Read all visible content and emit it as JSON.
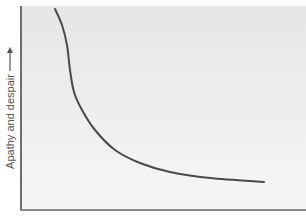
{
  "chart_data": {
    "type": "line",
    "title": "",
    "xlabel": "",
    "ylabel": "Apathy and despair",
    "ylabel_arrow": "up-arrow",
    "grid": false,
    "legend": null,
    "x_ticks": [],
    "y_ticks": [],
    "series": [
      {
        "name": "Apathy and despair curve",
        "color": "#4a4a4a",
        "points_px": [
          [
            55,
            9
          ],
          [
            62,
            25
          ],
          [
            67,
            45
          ],
          [
            70,
            70
          ],
          [
            74,
            92
          ],
          [
            82,
            110
          ],
          [
            95,
            130
          ],
          [
            115,
            150
          ],
          [
            140,
            163
          ],
          [
            170,
            172
          ],
          [
            210,
            178
          ],
          [
            264,
            182
          ]
        ]
      }
    ]
  },
  "colors": {
    "curve": "#4a4a4a",
    "axis": "#6e6e6e",
    "background_top": "#e6e6e6",
    "background_bottom": "#f6f6f6"
  }
}
